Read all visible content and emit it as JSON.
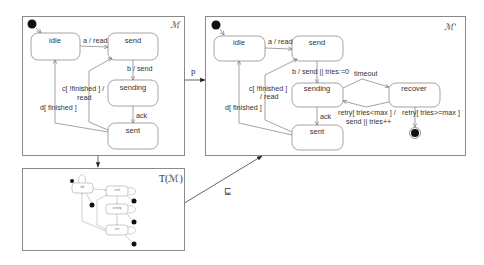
{
  "machine_m": {
    "title": "ℳ",
    "states": {
      "idle": "idle",
      "send": "send",
      "sending": "sending",
      "sent": "sent"
    },
    "transitions": {
      "idle_send": "a / read",
      "send_sending": "b / send",
      "sending_sent": "ack",
      "sent_send_line1": "c[ !finished ] /",
      "sent_send_line2": "read",
      "sent_idle": "d[ finished ]"
    }
  },
  "machine_m_prime": {
    "title": "ℳ'",
    "states": {
      "idle": "idle",
      "send": "send",
      "sending": "sending",
      "sent": "sent",
      "recover": "recover"
    },
    "transitions": {
      "idle_send": "a / read",
      "send_sending": "b / send || tries:=0",
      "sending_sent": "ack",
      "sent_send_line1": "c[ !finished ]",
      "sent_send_line2": "/ read",
      "sent_idle": "d[ finished ]",
      "sending_recover": "timeout",
      "recover_sending_line1": "retry[ tries<max ] /",
      "recover_sending_line2": "send || tries++",
      "recover_final": "retry[ tries>=max ]"
    }
  },
  "machine_t": {
    "title": "T(ℳ)",
    "states": {
      "idle": "idle",
      "send": "send",
      "sending": "sending",
      "sent": "sent"
    }
  },
  "relations": {
    "m_to_mprime": "p",
    "t_to_mprime": "⊑"
  }
}
